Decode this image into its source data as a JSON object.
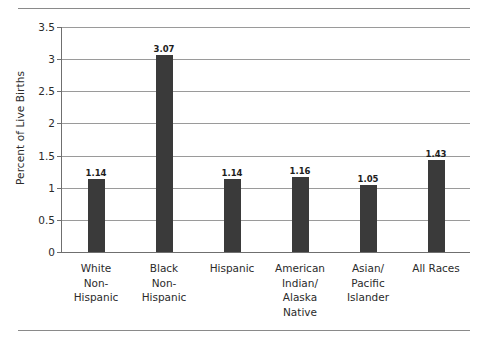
{
  "chart_data": {
    "type": "bar",
    "title": "",
    "xlabel": "",
    "ylabel": "Percent of Live Births",
    "ylim": [
      0,
      3.5
    ],
    "ytick_step": 0.5,
    "yticks": [
      "0",
      "0.5",
      "1",
      "1.5",
      "2",
      "2.5",
      "3",
      "3.5"
    ],
    "grid": true,
    "legend": false,
    "bar_color": "#3a3a3a",
    "gridline_color": "#9a9a9a",
    "axis_color": "#6f6f6f",
    "categories": [
      "White Non-Hispanic",
      "Black Non-Hispanic",
      "Hispanic",
      "American Indian/ Alaska Native",
      "Asian/ Pacific Islander",
      "All Races"
    ],
    "category_lines": [
      [
        "White",
        "Non-",
        "Hispanic"
      ],
      [
        "Black",
        "Non-",
        "Hispanic"
      ],
      [
        "Hispanic"
      ],
      [
        "American",
        "Indian/",
        "Alaska",
        "Native"
      ],
      [
        "Asian/",
        "Pacific",
        "Islander"
      ],
      [
        "All Races"
      ]
    ],
    "values": [
      1.14,
      3.07,
      1.14,
      1.16,
      1.05,
      1.43
    ],
    "value_labels": [
      "1.14",
      "3.07",
      "1.14",
      "1.16",
      "1.05",
      "1.43"
    ]
  }
}
